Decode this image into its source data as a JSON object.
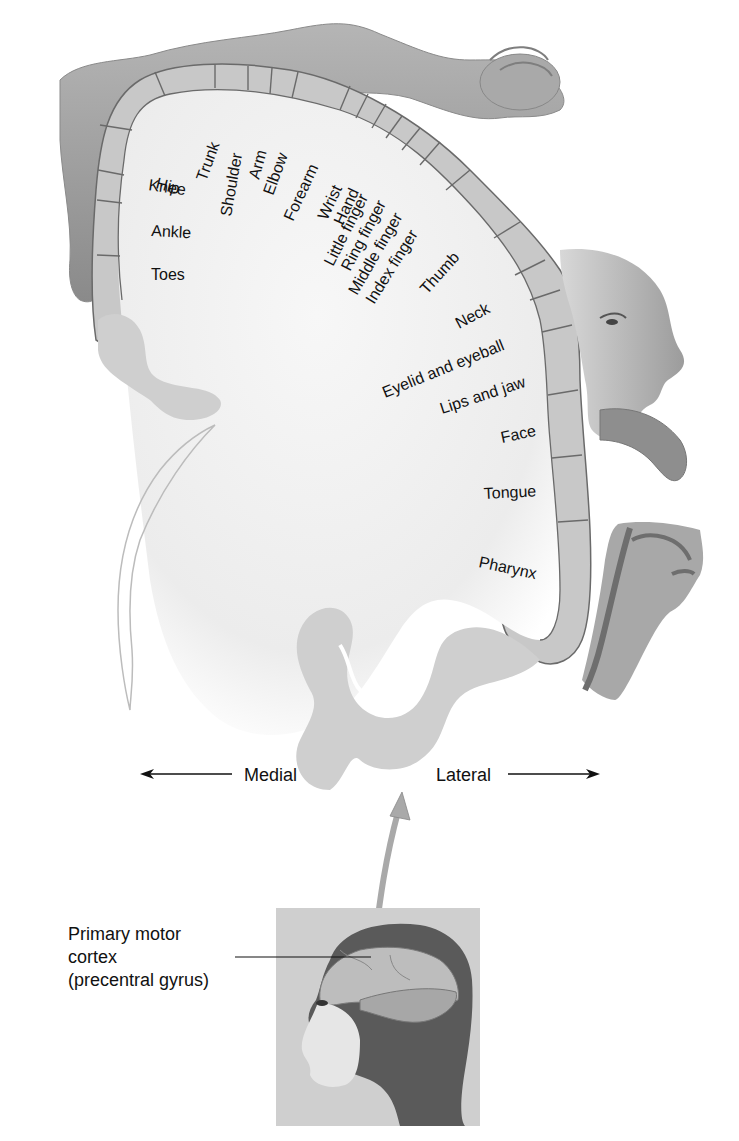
{
  "figure": {
    "colors": {
      "cortex_band": "#c8c8c8",
      "cortex_outline": "#6a6a6a",
      "white_matter": "#f0f0f0",
      "gyrus_gray": "#cfcfcf",
      "skin_gray": "#9a9a9a",
      "text": "#111111",
      "background": "#ffffff"
    }
  },
  "body_regions": [
    {
      "id": "hip",
      "label": "Hip"
    },
    {
      "id": "trunk",
      "label": "Trunk"
    },
    {
      "id": "knee",
      "label": "Knee"
    },
    {
      "id": "shoulder",
      "label": "Shoulder"
    },
    {
      "id": "arm",
      "label": "Arm"
    },
    {
      "id": "elbow",
      "label": "Elbow"
    },
    {
      "id": "ankle",
      "label": "Ankle"
    },
    {
      "id": "forearm",
      "label": "Forearm"
    },
    {
      "id": "wrist",
      "label": "Wrist"
    },
    {
      "id": "hand",
      "label": "Hand"
    },
    {
      "id": "toes",
      "label": "Toes"
    },
    {
      "id": "little_finger",
      "label": "Little finger"
    },
    {
      "id": "ring_finger",
      "label": "Ring finger"
    },
    {
      "id": "middle_finger",
      "label": "Middle finger"
    },
    {
      "id": "index_finger",
      "label": "Index finger"
    },
    {
      "id": "thumb",
      "label": "Thumb"
    },
    {
      "id": "neck",
      "label": "Neck"
    },
    {
      "id": "eyelid_eyeball",
      "label": "Eyelid and eyeball"
    },
    {
      "id": "lips_jaw",
      "label": "Lips and jaw"
    },
    {
      "id": "face",
      "label": "Face"
    },
    {
      "id": "tongue",
      "label": "Tongue"
    },
    {
      "id": "pharynx",
      "label": "Pharynx"
    }
  ],
  "orientation": {
    "medial": "Medial",
    "lateral": "Lateral"
  },
  "callout": {
    "line1": "Primary motor",
    "line2": "cortex",
    "line3": "(precentral gyrus)"
  }
}
